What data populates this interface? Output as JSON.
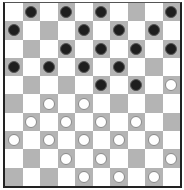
{
  "board": {
    "size": 10,
    "colors": {
      "light": "#ffffff",
      "dark": "#b4b4b4",
      "black_piece": "#1e1e1e",
      "white_piece": "#ffffff"
    },
    "black_pieces": [
      [
        0,
        1
      ],
      [
        0,
        3
      ],
      [
        0,
        5
      ],
      [
        0,
        9
      ],
      [
        1,
        0
      ],
      [
        1,
        4
      ],
      [
        1,
        6
      ],
      [
        1,
        8
      ],
      [
        2,
        3
      ],
      [
        2,
        5
      ],
      [
        2,
        7
      ],
      [
        2,
        9
      ],
      [
        3,
        0
      ],
      [
        3,
        2
      ],
      [
        3,
        4
      ],
      [
        3,
        6
      ],
      [
        4,
        5
      ],
      [
        4,
        7
      ]
    ],
    "white_pieces": [
      [
        4,
        9
      ],
      [
        5,
        2
      ],
      [
        5,
        4
      ],
      [
        6,
        1
      ],
      [
        6,
        3
      ],
      [
        6,
        5
      ],
      [
        6,
        7
      ],
      [
        7,
        0
      ],
      [
        7,
        2
      ],
      [
        7,
        4
      ],
      [
        7,
        6
      ],
      [
        7,
        8
      ],
      [
        8,
        3
      ],
      [
        8,
        5
      ],
      [
        8,
        9
      ],
      [
        9,
        4
      ],
      [
        9,
        6
      ],
      [
        9,
        8
      ]
    ]
  }
}
